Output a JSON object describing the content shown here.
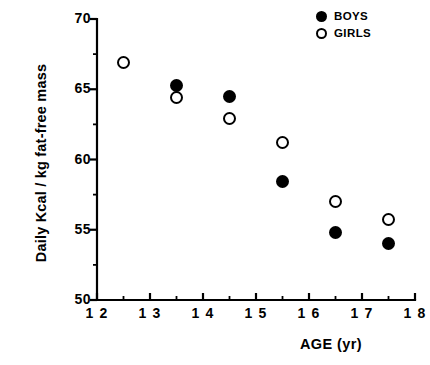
{
  "chart_data": {
    "type": "scatter",
    "title": "",
    "xlabel": "AGE  (yr)",
    "ylabel": "Daily Kcal / kg fat-free mass",
    "xlim": [
      12,
      18
    ],
    "ylim": [
      50,
      70
    ],
    "xticks": [
      12,
      13,
      14,
      15,
      16,
      17,
      18
    ],
    "xtick_labels": [
      "1 2",
      "1 3",
      "1 4",
      "1 5",
      "1 6",
      "1 7",
      "1 8"
    ],
    "xminor_ticks": [
      12.5,
      13.5,
      14.5,
      15.5,
      16.5,
      17.5
    ],
    "yticks": [
      50,
      55,
      60,
      65,
      70
    ],
    "ytick_labels": [
      "50",
      "55",
      "60",
      "65",
      "70"
    ],
    "yminor_ticks": [
      52.5,
      57.5,
      62.5,
      67.5
    ],
    "grid": false,
    "legend_position": "top-right",
    "series": [
      {
        "name": "BOYS",
        "marker": "filled-circle",
        "color": "#000000",
        "points": [
          {
            "x": 13.5,
            "y": 65.3
          },
          {
            "x": 14.5,
            "y": 64.5
          },
          {
            "x": 15.5,
            "y": 58.4
          },
          {
            "x": 16.5,
            "y": 54.8
          },
          {
            "x": 17.5,
            "y": 54.0
          }
        ]
      },
      {
        "name": "GIRLS",
        "marker": "open-circle",
        "color": "#000000",
        "points": [
          {
            "x": 12.5,
            "y": 66.9
          },
          {
            "x": 13.5,
            "y": 64.4
          },
          {
            "x": 14.5,
            "y": 62.9
          },
          {
            "x": 15.5,
            "y": 61.2
          },
          {
            "x": 16.5,
            "y": 57.0
          },
          {
            "x": 17.5,
            "y": 55.7
          }
        ]
      }
    ]
  },
  "legend": {
    "items": [
      {
        "label": "BOYS",
        "marker": "filled"
      },
      {
        "label": "GIRLS",
        "marker": "open"
      }
    ]
  },
  "axes": {
    "x_title": "AGE  (yr)",
    "y_title": "Daily Kcal / kg fat-free mass"
  },
  "caption_remnant": ""
}
